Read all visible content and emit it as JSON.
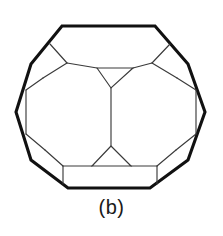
{
  "figure": {
    "caption": "(b)",
    "colors": {
      "background": "#ffffff",
      "outline_stroke": "#111111",
      "interior_stroke": "#3a3a3a",
      "caption_text": "#1a1a1a"
    },
    "diagram": {
      "type": "polyhedron-line-drawing",
      "description": "Truncated polyhedron wireframe shown in hexagonal silhouette",
      "outline_label": "outer-silhouette",
      "outline_points": "62,26 155,26 188,64 205,112 188,160 150,188 68,188 31,160 16,112 31,64",
      "interior_edges": [
        {
          "name": "left-vertex-chord",
          "points": "26,90 26,134"
        },
        {
          "name": "right-vertex-chord",
          "points": "196,90 196,134"
        },
        {
          "name": "upper-left-node-to-outline-a",
          "points": "67,63 50,44"
        },
        {
          "name": "upper-left-node-to-outline-b",
          "points": "67,63 43,78"
        },
        {
          "name": "upper-left-node-to-center",
          "points": "67,63 97,68"
        },
        {
          "name": "upper-right-node-to-outline-a",
          "points": "152,63 170,44"
        },
        {
          "name": "upper-right-node-to-outline-b",
          "points": "152,63 177,78"
        },
        {
          "name": "upper-right-node-to-center",
          "points": "152,63 133,68"
        },
        {
          "name": "central-upper-triangle",
          "points": "97,68 133,68 111,88 97,68"
        },
        {
          "name": "central-vertical-edge",
          "points": "111,88 111,146"
        },
        {
          "name": "central-lower-triangle",
          "points": "111,146 92,166 131,166 111,146"
        },
        {
          "name": "lower-left-node-to-outline-a",
          "points": "63,166 45,150"
        },
        {
          "name": "lower-left-node-to-outline-b",
          "points": "63,166 63,184"
        },
        {
          "name": "lower-left-node-to-center",
          "points": "63,166 92,166"
        },
        {
          "name": "lower-right-node-to-outline-a",
          "points": "157,166 176,150"
        },
        {
          "name": "lower-right-node-to-outline-b",
          "points": "157,166 157,184"
        },
        {
          "name": "lower-right-node-to-center",
          "points": "157,166 131,166"
        },
        {
          "name": "upper-left-face-chord",
          "points": "43,78 26,90"
        },
        {
          "name": "upper-right-face-chord",
          "points": "177,78 196,90"
        },
        {
          "name": "lower-left-face-chord",
          "points": "26,134 45,150"
        },
        {
          "name": "lower-right-face-chord",
          "points": "196,134 176,150"
        }
      ]
    }
  }
}
